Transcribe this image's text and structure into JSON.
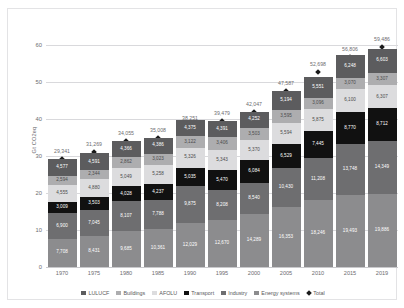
{
  "chart_data": {
    "type": "bar",
    "stacked": true,
    "title": "",
    "xlabel": "",
    "ylabel": "Gt CO2eq",
    "ylim": [
      0,
      65
    ],
    "yticks": [
      0,
      10,
      20,
      30,
      40,
      50,
      60
    ],
    "grid": true,
    "legend_position": "bottom",
    "units": "Mt CO2eq (segment labels), Gt CO2eq (axis)",
    "categories": [
      "1970",
      "1975",
      "1980",
      "1985",
      "1990",
      "1995",
      "2000",
      "2005",
      "2010",
      "2015",
      "2019"
    ],
    "series": [
      {
        "name": "Energy systems",
        "color": "#8c8c8e",
        "values": [
          7708,
          8431,
          9685,
          10361,
          12029,
          12670,
          14289,
          16353,
          18246,
          19493,
          19886
        ]
      },
      {
        "name": "Industry",
        "color": "#6e6e70",
        "values": [
          6900,
          7045,
          8107,
          7788,
          9875,
          8208,
          8540,
          10430,
          11208,
          13748,
          14349
        ]
      },
      {
        "name": "Transport",
        "color": "#111111",
        "values": [
          3009,
          3503,
          4028,
          4237,
          5035,
          5470,
          6084,
          6529,
          7445,
          8770,
          8712
        ]
      },
      {
        "name": "AFOLU",
        "color": "#dcdcde",
        "values": [
          4555,
          4880,
          5049,
          5258,
          5326,
          5343,
          5370,
          5594,
          5875,
          6100,
          6307
        ]
      },
      {
        "name": "Buildings",
        "color": "#adadaf",
        "values": [
          2594,
          2344,
          2862,
          3023,
          3122,
          3406,
          3503,
          3595,
          3096,
          3070,
          3307
        ]
      },
      {
        "name": "LULUCF",
        "color": "#5c5c5e",
        "values": [
          4577,
          4591,
          4366,
          4386,
          4375,
          4391,
          4252,
          5194,
          5551,
          6248,
          6603
        ]
      }
    ],
    "totals": [
      29341,
      31269,
      34055,
      35008,
      38251,
      39479,
      42047,
      47587,
      52698,
      56806,
      59486
    ],
    "total_label": "Total",
    "total_marker": "diamond",
    "total_marker_color": "#1a1a1a"
  },
  "legend": {
    "items": [
      {
        "label": "LULUCF",
        "color": "#5c5c5e",
        "shape": "square"
      },
      {
        "label": "Buildings",
        "color": "#adadaf",
        "shape": "square"
      },
      {
        "label": "AFOLU",
        "color": "#dcdcde",
        "shape": "square"
      },
      {
        "label": "Transport",
        "color": "#111111",
        "shape": "square"
      },
      {
        "label": "Industry",
        "color": "#6e6e70",
        "shape": "square"
      },
      {
        "label": "Energy systems",
        "color": "#8c8c8e",
        "shape": "square"
      },
      {
        "label": "Total",
        "color": "#1a1a1a",
        "shape": "diamond"
      }
    ]
  },
  "axis": {
    "y_label": "Gt CO2eq",
    "y_ticks": [
      "0",
      "10",
      "20",
      "30",
      "40",
      "50",
      "60"
    ],
    "x_ticks": [
      "1970",
      "1975",
      "1980",
      "1985",
      "1990",
      "1995",
      "2000",
      "2005",
      "2010",
      "2015",
      "2019"
    ]
  }
}
